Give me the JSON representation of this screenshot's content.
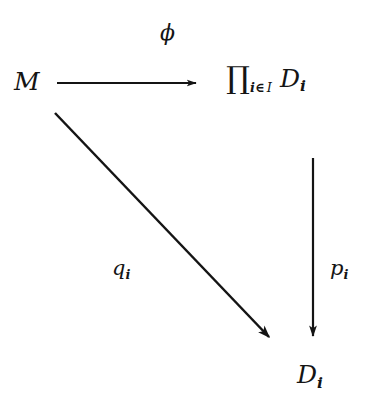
{
  "diagram": {
    "kind": "commutative-diagram",
    "background_color": "#ffffff",
    "ink_color": "#141414",
    "nodes": [
      {
        "id": "M",
        "name": "source-object",
        "text": "M",
        "position": {
          "x": 14,
          "y": 69
        }
      },
      {
        "id": "product",
        "name": "product-object",
        "text": "∏",
        "subscript_index": "i",
        "subscript_membership": "∈",
        "subscript_set": "I",
        "factor": "D",
        "factor_subscript": "i",
        "position": {
          "x": 226,
          "y": 63
        }
      },
      {
        "id": "D_i",
        "name": "target-object",
        "text": "D",
        "subscript": "i",
        "position": {
          "x": 297,
          "y": 362
        }
      }
    ],
    "arrows": [
      {
        "id": "phi-arrow",
        "name": "horizontal-arrow",
        "from": "M",
        "to": "product",
        "label": "ϕ",
        "direction": "right",
        "x1": 57,
        "y1": 83,
        "x2": 204,
        "y2": 83
      },
      {
        "id": "q-arrow",
        "name": "diagonal-arrow",
        "from": "M",
        "to": "D_i",
        "label": "q",
        "label_subscript": "i",
        "direction": "down-right",
        "x1": 55,
        "y1": 113,
        "x2": 277,
        "y2": 345
      },
      {
        "id": "p-arrow",
        "name": "vertical-arrow",
        "from": "product",
        "to": "D_i",
        "label": "p",
        "label_subscript": "i",
        "direction": "down",
        "x1": 313,
        "y1": 158,
        "x2": 313,
        "y2": 345
      }
    ],
    "labels": {
      "phi": "ϕ",
      "q": "q",
      "q_subscript": "i",
      "p": "p",
      "p_subscript": "i"
    }
  }
}
